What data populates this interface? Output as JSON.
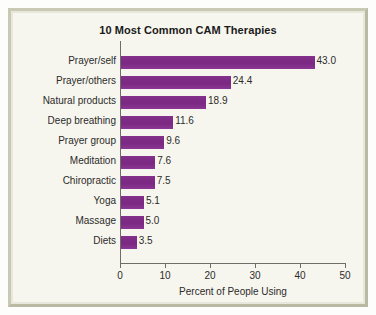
{
  "chart_data": {
    "type": "bar",
    "orientation": "horizontal",
    "title": "10 Most Common CAM Therapies",
    "xlabel": "Percent of People Using",
    "ylabel": "",
    "xlim": [
      0,
      50
    ],
    "xticks": [
      "0",
      "10",
      "20",
      "30",
      "40",
      "50"
    ],
    "xtick_values": [
      0,
      10,
      20,
      30,
      40,
      50
    ],
    "grid": false,
    "legend": null,
    "categories": [
      "Prayer/self",
      "Prayer/others",
      "Natural products",
      "Deep breathing",
      "Prayer group",
      "Meditation",
      "Chiropractic",
      "Yoga",
      "Massage",
      "Diets"
    ],
    "values": [
      43.0,
      24.4,
      18.9,
      11.6,
      9.6,
      7.6,
      7.5,
      5.1,
      5.0,
      3.5
    ],
    "value_labels": [
      "43.0",
      "24.4",
      "18.9",
      "11.6",
      "9.6",
      "7.6",
      "7.5",
      "5.1",
      "5.0",
      "3.5"
    ],
    "bar_color": "#7d2b86",
    "background_color": "#f7f6ee",
    "frame_color": "#c9c9b4",
    "axis_color": "#6e6e66",
    "text_color": "#2b2b2b"
  }
}
